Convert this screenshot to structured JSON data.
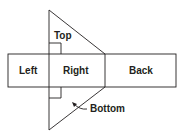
{
  "diagram": {
    "type": "net-of-triangular-prism",
    "stroke_color": "#231f20",
    "labels": {
      "top": "Top",
      "left": "Left",
      "right": "Right",
      "back": "Back",
      "bottom": "Bottom"
    }
  }
}
